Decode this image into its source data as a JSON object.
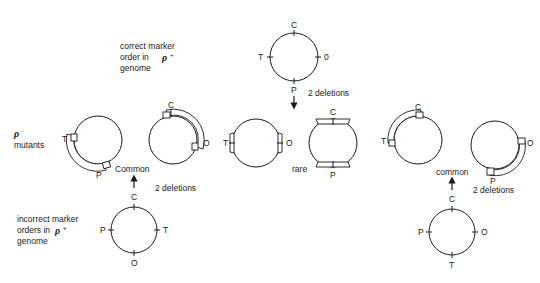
{
  "labels": {
    "correct_order": [
      "correct marker",
      "order in",
      "genome"
    ],
    "correct_rho_sup": "+",
    "mutants_rho_sup": "-",
    "mutants": "mutants",
    "incorrect_order": [
      "incorrect marker",
      "orders in",
      "genome"
    ],
    "incorrect_rho_sup": "+",
    "rho": "ρ"
  },
  "annotations": {
    "top_deletions": "2 deletions",
    "left_common": "Common",
    "left_deletions": "2 deletions",
    "rare": "rare",
    "right_common": "common",
    "right_deletions": "2 deletions"
  },
  "genomes": {
    "correct": {
      "top": "C",
      "right": "0",
      "bottom": "P",
      "left": "T"
    },
    "incorrect_left": {
      "top": "C",
      "right": "T",
      "bottom": "O",
      "left": "P"
    },
    "incorrect_right": {
      "top": "C",
      "right": "O",
      "bottom": "T",
      "left": "P"
    }
  },
  "mutants": [
    {
      "id": "left-a",
      "markers": [
        "T",
        "P"
      ]
    },
    {
      "id": "left-b",
      "markers": [
        "C",
        "O"
      ]
    },
    {
      "id": "mid-a",
      "markers": [
        "T",
        "O"
      ]
    },
    {
      "id": "mid-b",
      "markers": [
        "C",
        "P"
      ]
    },
    {
      "id": "right-a",
      "markers": [
        "C",
        "T"
      ]
    },
    {
      "id": "right-b",
      "markers": [
        "O",
        "P"
      ]
    }
  ]
}
